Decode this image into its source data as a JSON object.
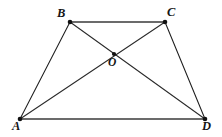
{
  "figure": {
    "canvas": {
      "width": 222,
      "height": 137
    },
    "background_color": "#ffffff",
    "labels": {
      "a": "A",
      "b": "B",
      "c": "C",
      "d": "D",
      "o": "O"
    },
    "points": {
      "A": {
        "x": 20,
        "y": 119
      },
      "B": {
        "x": 70,
        "y": 22
      },
      "C": {
        "x": 165,
        "y": 22
      },
      "D": {
        "x": 205,
        "y": 119
      },
      "O": {
        "x": 114,
        "y": 54
      }
    },
    "label_positions": {
      "A": {
        "x": 12,
        "y": 120
      },
      "B": {
        "x": 57,
        "y": 7
      },
      "C": {
        "x": 167,
        "y": 6
      },
      "D": {
        "x": 202,
        "y": 120
      },
      "O": {
        "x": 108,
        "y": 57
      }
    },
    "segments": [
      {
        "name": "BC",
        "from": "B",
        "to": "C",
        "style": "thick",
        "color": "#6b6b6b",
        "width": 2.2
      },
      {
        "name": "AD",
        "from": "A",
        "to": "D",
        "style": "thick",
        "color": "#6b6b6b",
        "width": 2.2
      },
      {
        "name": "AB",
        "from": "A",
        "to": "B",
        "style": "thin",
        "color": "#1e1e1e",
        "width": 1.05
      },
      {
        "name": "CD",
        "from": "C",
        "to": "D",
        "style": "thin",
        "color": "#1e1e1e",
        "width": 1.05
      },
      {
        "name": "AC",
        "from": "A",
        "to": "C",
        "style": "diagonal",
        "color": "#2a2a2a",
        "width": 1.05
      },
      {
        "name": "BD",
        "from": "B",
        "to": "D",
        "style": "diagonal",
        "color": "#2a2a2a",
        "width": 1.05
      }
    ],
    "vertex_marker": {
      "shape": "dot",
      "radius": 2.3,
      "color": "#111111"
    },
    "intersection_marker": {
      "shape": "dot",
      "radius": 2.1,
      "color": "#111111"
    }
  }
}
